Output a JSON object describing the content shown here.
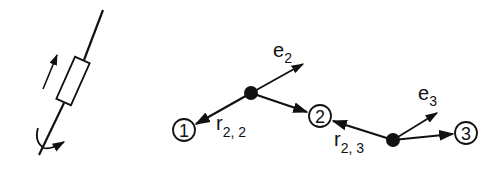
{
  "diagram": {
    "left_figure": {
      "description": "link element on axis with translation arrow and rotation arrow"
    },
    "nodes": [
      {
        "id": "node-1",
        "label": "1"
      },
      {
        "id": "node-2",
        "label": "2"
      },
      {
        "id": "node-3",
        "label": "3"
      }
    ],
    "vectors": {
      "e2": {
        "base": "e",
        "sub": "2"
      },
      "e3": {
        "base": "e",
        "sub": "3"
      },
      "r22": {
        "base": "r",
        "sub": "2, 2"
      },
      "r23": {
        "base": "r",
        "sub": "2, 3"
      }
    },
    "colors": {
      "ink": "#111111",
      "background": "#ffffff"
    }
  }
}
